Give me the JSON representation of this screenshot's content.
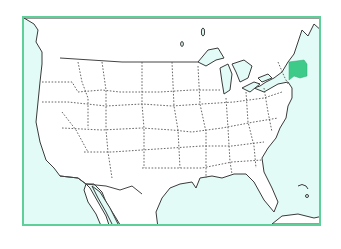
{
  "map": {
    "type": "outline map",
    "region": "United States (contiguous)",
    "highlighted_state": "Massachusetts",
    "colors": {
      "frame": "#5fcf9a",
      "water": "#e3fbf6",
      "land": "#ffffff",
      "highlight": "#3ecb8a",
      "borders": "#555555"
    }
  }
}
